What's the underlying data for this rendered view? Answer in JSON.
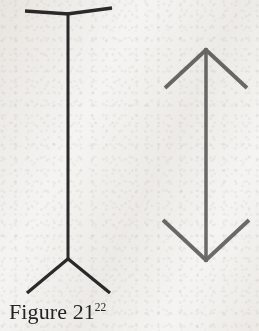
{
  "page": {
    "width": 259,
    "height": 331,
    "background_color": "#f5f4f2",
    "medium": "scanned-book-page"
  },
  "caption": {
    "text": "Figure 21",
    "footnote_marker": "22",
    "full_text": "Figure 21²²",
    "color": "#232323",
    "font_style": "serif"
  },
  "illusion": {
    "name": "Muller-Lyer",
    "figure_count": 2
  },
  "figures": [
    {
      "id": "left",
      "name": "muller-lyer-fins-out",
      "description": "Vertical shaft with outward-pointing fins (Y at top, inverted Y at bottom)",
      "stroke_color": "#2a2a2a",
      "stroke_width": 3,
      "shaft": {
        "x": 68,
        "y_top": 13,
        "y_bottom": 259
      },
      "top_fins": [
        {
          "from_x": 68,
          "from_y": 13,
          "to_x": 25,
          "to_y": 11
        },
        {
          "from_x": 68,
          "from_y": 13,
          "to_x": 112,
          "to_y": 8
        }
      ],
      "bottom_fins": [
        {
          "from_x": 68,
          "from_y": 259,
          "to_x": 27,
          "to_y": 293
        },
        {
          "from_x": 68,
          "from_y": 259,
          "to_x": 110,
          "to_y": 293
        }
      ]
    },
    {
      "id": "right",
      "name": "muller-lyer-arrows-in",
      "description": "Vertical shaft with inward-pointing arrowheads at both ends",
      "stroke_color": "#6a6a68",
      "stroke_width": 3.5,
      "shaft": {
        "x": 206,
        "y_top": 48,
        "y_bottom": 262
      },
      "top_arrowhead": [
        {
          "from_x": 206,
          "from_y": 48,
          "to_x": 165,
          "to_y": 88
        },
        {
          "from_x": 206,
          "from_y": 48,
          "to_x": 247,
          "to_y": 88
        }
      ],
      "bottom_arrowhead": [
        {
          "from_x": 206,
          "from_y": 262,
          "to_x": 163,
          "to_y": 220
        },
        {
          "from_x": 206,
          "from_y": 262,
          "to_x": 249,
          "to_y": 220
        }
      ]
    }
  ]
}
